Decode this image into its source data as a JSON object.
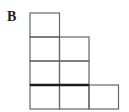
{
  "figure": {
    "label": "B",
    "grid": {
      "origin_x": 30,
      "origin_y": 13,
      "cell_width": 29.5,
      "cell_height": 24
    },
    "cells": [
      {
        "col": 0,
        "row": 0
      },
      {
        "col": 0,
        "row": 1
      },
      {
        "col": 1,
        "row": 1
      },
      {
        "col": 0,
        "row": 2
      },
      {
        "col": 1,
        "row": 2
      },
      {
        "col": 0,
        "row": 3
      },
      {
        "col": 1,
        "row": 3
      },
      {
        "col": 2,
        "row": 3
      }
    ],
    "row_counts_top_to_bottom": [
      1,
      2,
      2,
      3
    ],
    "thick_segment": {
      "edge": "top-of-bottom-row",
      "row": 3,
      "col_start": 0,
      "col_end": 2,
      "stroke_width": 2.5
    },
    "colors": {
      "background": "#ffffff",
      "line": "#666666",
      "thick_line": "#1b1b1b",
      "label": "#1d1d1d"
    }
  }
}
